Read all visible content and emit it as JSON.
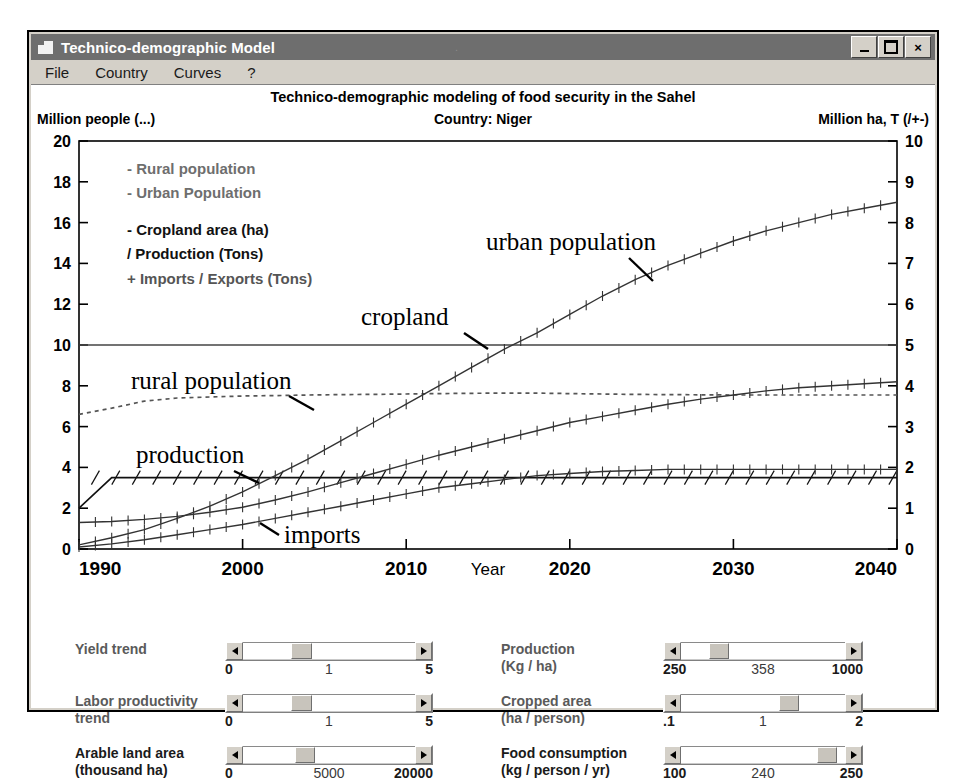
{
  "window": {
    "title": "Technico-demographic Model",
    "icon": "app-icon",
    "buttons": {
      "minimize": "_",
      "maximize": "□",
      "close": "×"
    }
  },
  "menu": {
    "items": [
      "File",
      "Country",
      "Curves",
      "?"
    ]
  },
  "header": {
    "chart_title": "Technico-demographic modeling of  food security in the Sahel",
    "left_axis_title": "Million people (...)",
    "country": "Country: Niger",
    "right_axis_title": "Million ha, T (/+-)"
  },
  "legend": {
    "lines": [
      "- Rural population",
      "- Urban Population",
      "- Cropland area (ha)",
      "/ Production (Tons)",
      "+ Imports / Exports (Tons)"
    ]
  },
  "annotations": {
    "urban": "urban population",
    "cropland": "cropland",
    "rural": "rural population",
    "production": "production",
    "imports": "imports"
  },
  "chart_data": {
    "type": "line",
    "title": "Technico-demographic modeling of  food security in the Sahel",
    "xlabel": "Year",
    "ylabel": "Million people (...)",
    "y2label": "Million ha, T (/+-)",
    "xlim": [
      1990,
      2040
    ],
    "ylim": [
      0,
      20
    ],
    "y2lim": [
      0,
      10
    ],
    "xticks": [
      1990,
      2000,
      2010,
      2020,
      2030,
      2040
    ],
    "yticks": [
      0,
      2,
      4,
      6,
      8,
      10,
      12,
      14,
      16,
      18,
      20
    ],
    "y2ticks": [
      0,
      1,
      2,
      3,
      4,
      5,
      6,
      7,
      8,
      9,
      10
    ],
    "grid": false,
    "legend_position": "inside-top-left",
    "x": [
      1990,
      1992,
      1994,
      1996,
      1998,
      2000,
      2002,
      2004,
      2006,
      2008,
      2010,
      2012,
      2014,
      2016,
      2018,
      2020,
      2022,
      2024,
      2026,
      2028,
      2030,
      2032,
      2034,
      2036,
      2038,
      2040
    ],
    "series": [
      {
        "name": "rural population",
        "axis": "left",
        "style": "dotted",
        "values": [
          6.6,
          6.9,
          7.25,
          7.4,
          7.45,
          7.5,
          7.52,
          7.55,
          7.57,
          7.58,
          7.6,
          7.62,
          7.63,
          7.64,
          7.64,
          7.62,
          7.6,
          7.58,
          7.57,
          7.56,
          7.55,
          7.55,
          7.55,
          7.55,
          7.55,
          7.55
        ]
      },
      {
        "name": "urban population",
        "axis": "left",
        "style": "plus-markers",
        "values": [
          0.2,
          0.55,
          0.95,
          1.5,
          2.1,
          2.8,
          3.6,
          4.4,
          5.3,
          6.2,
          7.1,
          8.0,
          8.9,
          9.8,
          10.6,
          11.5,
          12.4,
          13.2,
          13.9,
          14.5,
          15.1,
          15.6,
          16.0,
          16.4,
          16.7,
          17.0
        ]
      },
      {
        "name": "cropland",
        "axis": "left",
        "style": "solid",
        "values": [
          10,
          10,
          10,
          10,
          10,
          10,
          10,
          10,
          10,
          10,
          10,
          10,
          10,
          10,
          10,
          10,
          10,
          10,
          10,
          10,
          10,
          10,
          10,
          10,
          10,
          10
        ]
      },
      {
        "name": "production",
        "axis": "left",
        "style": "hatched",
        "values": [
          2.0,
          3.5,
          3.5,
          3.5,
          3.5,
          3.5,
          3.5,
          3.5,
          3.5,
          3.5,
          3.5,
          3.5,
          3.5,
          3.5,
          3.5,
          3.5,
          3.5,
          3.5,
          3.5,
          3.5,
          3.5,
          3.5,
          3.5,
          3.5,
          3.5,
          3.5
        ]
      },
      {
        "name": "imports",
        "axis": "left",
        "style": "plus-markers",
        "values": [
          1.3,
          1.35,
          1.45,
          1.6,
          1.8,
          2.05,
          2.4,
          2.8,
          3.25,
          3.7,
          4.15,
          4.6,
          5.0,
          5.4,
          5.8,
          6.2,
          6.5,
          6.8,
          7.1,
          7.35,
          7.55,
          7.75,
          7.9,
          8.0,
          8.1,
          8.2
        ]
      },
      {
        "name": "exports",
        "axis": "left",
        "style": "plus-markers-low",
        "values": [
          0.1,
          0.25,
          0.45,
          0.7,
          0.95,
          1.2,
          1.5,
          1.8,
          2.1,
          2.4,
          2.7,
          3.0,
          3.2,
          3.4,
          3.6,
          3.7,
          3.8,
          3.85,
          3.9,
          3.9,
          3.9,
          3.9,
          3.9,
          3.9,
          3.9,
          3.9
        ]
      }
    ]
  },
  "controls": {
    "left": [
      {
        "label": "Yield trend",
        "label2": "",
        "dim": true,
        "min": "0",
        "mid": "1",
        "max": "5",
        "thumb_pct": 28,
        "thumb_w_pct": 12
      },
      {
        "label": "Labor productivity",
        "label2": "trend",
        "dim": true,
        "min": "0",
        "mid": "1",
        "max": "5",
        "thumb_pct": 28,
        "thumb_w_pct": 12
      },
      {
        "label": "Arable land area",
        "label2": "(thousand ha)",
        "dim": false,
        "min": "0",
        "mid": "5000",
        "max": "20000",
        "thumb_pct": 30,
        "thumb_w_pct": 12
      }
    ],
    "right": [
      {
        "label": "Production",
        "label2": "(Kg / ha)",
        "dim": true,
        "min": "250",
        "mid": "358",
        "max": "1000",
        "thumb_pct": 17,
        "thumb_w_pct": 12
      },
      {
        "label": "Cropped area",
        "label2": "(ha / person)",
        "dim": true,
        "min": ".1",
        "mid": "1",
        "max": "2",
        "thumb_pct": 60,
        "thumb_w_pct": 12
      },
      {
        "label": "Food consumption",
        "label2": "(kg / person / yr)",
        "dim": false,
        "min": "100",
        "mid": "240",
        "max": "250",
        "thumb_pct": 83,
        "thumb_w_pct": 12
      }
    ]
  }
}
